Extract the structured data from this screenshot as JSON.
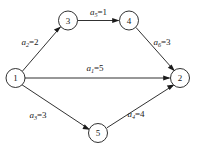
{
  "diagram": {
    "type": "directed-weighted-graph",
    "background_color": "#ffffff",
    "line_color": "#1a1a1a",
    "nodes": [
      {
        "id": "1",
        "label": "1",
        "cx": 15.5,
        "cy": 78,
        "r": 9.5
      },
      {
        "id": "2",
        "label": "2",
        "cx": 180,
        "cy": 78,
        "r": 9.5
      },
      {
        "id": "3",
        "label": "3",
        "cx": 68,
        "cy": 20.5,
        "r": 9.5
      },
      {
        "id": "4",
        "label": "4",
        "cx": 129,
        "cy": 20.5,
        "r": 9.5
      },
      {
        "id": "5",
        "label": "5",
        "cx": 98,
        "cy": 133,
        "r": 9.5
      }
    ],
    "edges": [
      {
        "id": "edge-1-3",
        "from": "1",
        "to": "3",
        "var": "a",
        "subscript": "2",
        "weight": "2",
        "label": "a₂=2",
        "label_x": 30,
        "label_y": 42,
        "label_rotate": 0
      },
      {
        "id": "edge-3-4",
        "from": "3",
        "to": "4",
        "var": "a",
        "subscript": "5",
        "weight": "1",
        "label": "a₅=1",
        "label_x": 98.5,
        "label_y": 12,
        "label_rotate": 0
      },
      {
        "id": "edge-4-2",
        "from": "4",
        "to": "2",
        "var": "a",
        "subscript": "6",
        "weight": "3",
        "label": "a₆=3",
        "label_x": 162,
        "label_y": 42,
        "label_rotate": 0
      },
      {
        "id": "edge-1-2",
        "from": "1",
        "to": "2",
        "var": "a",
        "subscript": "1",
        "weight": "5",
        "label": "a₁=5",
        "label_x": 95,
        "label_y": 68,
        "label_rotate": 0
      },
      {
        "id": "edge-1-5",
        "from": "1",
        "to": "5",
        "var": "a",
        "subscript": "3",
        "weight": "3",
        "label": "a₃=3",
        "label_x": 38,
        "label_y": 115,
        "label_rotate": 0
      },
      {
        "id": "edge-5-2",
        "from": "5",
        "to": "2",
        "var": "a",
        "subscript": "4",
        "weight": "4",
        "label": "a₄=4",
        "label_x": 136,
        "label_y": 114,
        "label_rotate": 0
      }
    ]
  }
}
